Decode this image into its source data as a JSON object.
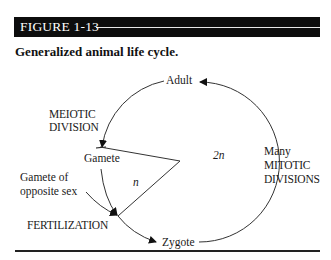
{
  "figure": {
    "number_label": "FIGURE 1-13",
    "caption": "Generalized animal life cycle."
  },
  "diagram": {
    "stages": {
      "adult": "Adult",
      "gamete": "Gamete",
      "zygote": "Zygote",
      "gamete_opposite": [
        "Gamete of",
        "opposite sex"
      ]
    },
    "processes": {
      "meiotic": [
        "MEIOTIC",
        "DIVISION"
      ],
      "mitotic": [
        "Many",
        "MITOTIC",
        "DIVISIONS"
      ],
      "fertilization": "FERTILIZATION"
    },
    "ploidy": {
      "haploid": "n",
      "diploid": "2n"
    }
  }
}
